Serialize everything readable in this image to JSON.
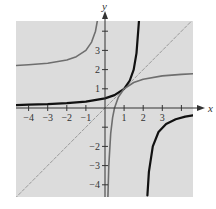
{
  "chart_data": {
    "type": "line",
    "title": "",
    "xlabel": "x",
    "ylabel": "y",
    "xlim": [
      -4.7,
      4.6
    ],
    "ylim": [
      -4.7,
      4.6
    ],
    "grid": false,
    "background": "#dcdcdc",
    "x_ticks": [
      -4,
      -3,
      -2,
      -1,
      1,
      2,
      3,
      4
    ],
    "x_tick_labels": [
      "−4",
      "−3",
      "−2",
      "−1",
      "1",
      "2",
      "3",
      ""
    ],
    "y_ticks": [
      -4,
      -3,
      -2,
      -1,
      1,
      2,
      3,
      4
    ],
    "y_tick_labels": [
      "−4",
      "−3",
      "−2",
      "",
      "1",
      "2",
      "3",
      ""
    ],
    "series": [
      {
        "name": "f (black)",
        "color": "#111111",
        "width": 2.2,
        "style": "solid",
        "description": "left branch: approaches y=0 as x→−∞, rises to vertical asymptote near x≈1.9; right branch: rises from bottom near x≈2.2 toward y≈−0.3 at x=4.6",
        "branches": [
          {
            "x": [
              -4.7,
              -4,
              -3,
              -2,
              -1,
              0,
              0.5,
              1,
              1.3,
              1.5,
              1.65,
              1.78
            ],
            "y": [
              0.15,
              0.17,
              0.2,
              0.25,
              0.33,
              0.5,
              0.67,
              1.0,
              1.43,
              2.0,
              2.86,
              4.55
            ]
          },
          {
            "x": [
              2.22,
              2.3,
              2.5,
              2.8,
              3.2,
              3.7,
              4.2,
              4.6
            ],
            "y": [
              -4.55,
              -3.33,
              -2.0,
              -1.25,
              -0.83,
              -0.59,
              -0.45,
              -0.38
            ]
          }
        ]
      },
      {
        "name": "f⁻¹ (gray)",
        "color": "#6e6e6e",
        "width": 1.6,
        "style": "solid",
        "description": "reflection of f across y=x; upper-left branch approaches y≈2 as x→−∞ and rises near x≈−0.4; right branch rises from bottom near x≈0.2 through (0.5,0) toward y≈1.2–1.8",
        "branches": [
          {
            "x": [
              -4.7,
              -4,
              -3,
              -2,
              -1.5,
              -1,
              -0.7,
              -0.5,
              -0.37
            ],
            "y": [
              2.21,
              2.25,
              2.33,
              2.5,
              2.67,
              3.0,
              3.43,
              4.0,
              4.7
            ]
          },
          {
            "x": [
              0.15,
              0.2,
              0.3,
              0.4,
              0.5,
              0.7,
              1.0,
              1.5,
              2.0,
              3.0,
              4.0,
              4.6
            ],
            "y": [
              -4.67,
              -3.0,
              -1.33,
              -0.5,
              0.0,
              0.57,
              1.0,
              1.33,
              1.5,
              1.67,
              1.75,
              1.78
            ]
          }
        ]
      },
      {
        "name": "y = x",
        "color": "#9a9a9a",
        "width": 1.0,
        "style": "dashed",
        "branches": [
          {
            "x": [
              -4.7,
              4.6
            ],
            "y": [
              -4.7,
              4.6
            ]
          }
        ]
      }
    ]
  }
}
